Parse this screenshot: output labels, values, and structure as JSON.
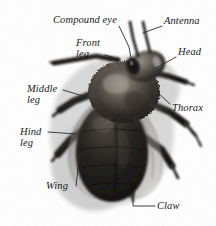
{
  "figure": {
    "background_color": "#ffffff",
    "text_color": "#1a1a1a",
    "leader_line_color": "#2b2b2b",
    "width": 216,
    "height": 226
  },
  "labels": [
    {
      "id": "compound-eye",
      "text": "Compound eye",
      "x": 53,
      "y": 14,
      "lines": 1,
      "leader": [
        [
          119,
          26
        ],
        [
          129,
          47
        ],
        [
          131,
          58
        ]
      ]
    },
    {
      "id": "antenna",
      "text": "Antenna",
      "x": 164,
      "y": 15,
      "lines": 1,
      "leader": [
        [
          162,
          26
        ],
        [
          143,
          33
        ]
      ]
    },
    {
      "id": "front-leg",
      "text": "Front\nleg",
      "x": 76,
      "y": 37,
      "lines": 2,
      "leader": [
        [
          105,
          55
        ],
        [
          118,
          59
        ]
      ]
    },
    {
      "id": "head",
      "text": "Head",
      "x": 178,
      "y": 46,
      "lines": 1,
      "leader": [
        [
          176,
          57
        ],
        [
          156,
          68
        ]
      ]
    },
    {
      "id": "middle-leg",
      "text": "Middle\nleg",
      "x": 27,
      "y": 83,
      "lines": 2,
      "leader": [
        [
          63,
          90
        ],
        [
          83,
          96
        ]
      ]
    },
    {
      "id": "thorax",
      "text": "Thorax",
      "x": 172,
      "y": 102,
      "lines": 1,
      "leader": [
        [
          170,
          104
        ],
        [
          157,
          92
        ]
      ]
    },
    {
      "id": "hind-leg",
      "text": "Hind\nleg",
      "x": 20,
      "y": 126,
      "lines": 2,
      "leader": [
        [
          48,
          132
        ],
        [
          76,
          134
        ]
      ]
    },
    {
      "id": "wing",
      "text": "Wing",
      "x": 46,
      "y": 180,
      "lines": 1,
      "leader": [
        [
          76,
          186
        ],
        [
          80,
          152
        ]
      ]
    },
    {
      "id": "claw",
      "text": "Claw",
      "x": 157,
      "y": 200,
      "lines": 1,
      "leader": [
        [
          155,
          206
        ],
        [
          133,
          206
        ],
        [
          133,
          194
        ]
      ]
    }
  ]
}
